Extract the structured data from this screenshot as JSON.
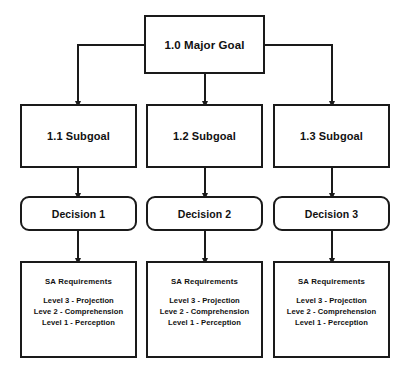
{
  "diagram": {
    "background_color": "#ffffff",
    "line_color": "#1a1a1a",
    "text_color": "#111111"
  },
  "goal": {
    "label": "1.0 Major Goal"
  },
  "subgoals": [
    {
      "label": "1.1 Subgoal"
    },
    {
      "label": "1.2 Subgoal"
    },
    {
      "label": "1.3 Subgoal"
    }
  ],
  "decisions": [
    {
      "label": "Decision 1"
    },
    {
      "label": "Decision 2"
    },
    {
      "label": "Decision 3"
    }
  ],
  "requirements": [
    {
      "title": "SA Requirements",
      "levels": [
        "Level 3 - Projection",
        "Leve 2 - Comprehension",
        "Level 1 - Perception"
      ]
    },
    {
      "title": "SA Requirements",
      "levels": [
        "Level 3 - Projection",
        "Leve 2 - Comprehension",
        "Level 1 - Perception"
      ]
    },
    {
      "title": "SA Requirements",
      "levels": [
        "Level 3 - Projection",
        "Leve 2 - Comprehension",
        "Level 1 - Perception"
      ]
    }
  ]
}
